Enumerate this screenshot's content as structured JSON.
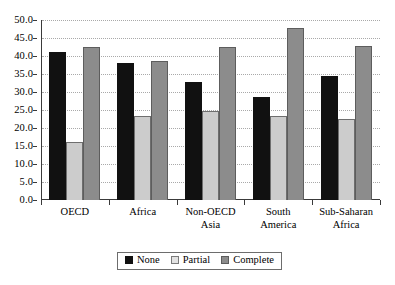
{
  "chart_data": {
    "type": "bar",
    "title": "",
    "subtitle": "",
    "xlabel": "",
    "ylabel": "",
    "ylim": [
      0,
      50
    ],
    "ytick_step": 5,
    "grid": true,
    "grid_style": "dotted-horizontal",
    "legend_position": "bottom-center",
    "categories": [
      "OECD",
      "Non-OECD\nAsia",
      "South\nAmerica",
      "Sub-Saharan\nAfrica",
      "Africa"
    ],
    "category_labels": [
      {
        "line1": "OECD",
        "line2": ""
      },
      {
        "line1": "Africa",
        "line2": ""
      },
      {
        "line1": "Non-OECD",
        "line2": "Asia"
      },
      {
        "line1": "South",
        "line2": "America"
      },
      {
        "line1": "Sub-Saharan",
        "line2": "Africa"
      }
    ],
    "ytick_labels": [
      "50.0",
      "45.0",
      "40.0",
      "35.0",
      "30.0",
      "25.0",
      "20.0",
      "15.0",
      "10.0",
      "5.0",
      "0.0"
    ],
    "ytick_values": [
      50,
      45,
      40,
      35,
      30,
      25,
      20,
      15,
      10,
      5,
      0
    ],
    "series": [
      {
        "name": "None",
        "color": "#111111",
        "values": [
          41.2,
          38.0,
          32.9,
          28.5,
          34.4
        ]
      },
      {
        "name": "Partial",
        "color": "#cccccc",
        "values": [
          16.0,
          23.4,
          24.6,
          23.4,
          22.4
        ]
      },
      {
        "name": "Complete",
        "color": "#8c8c8c",
        "values": [
          42.6,
          38.7,
          42.4,
          47.9,
          42.9
        ]
      }
    ]
  },
  "legend": {
    "items": [
      {
        "label": "None",
        "swatch": "legend-swatch-none"
      },
      {
        "label": "Partial",
        "swatch": "legend-swatch-partial"
      },
      {
        "label": "Complete",
        "swatch": "legend-swatch-complete"
      }
    ]
  }
}
